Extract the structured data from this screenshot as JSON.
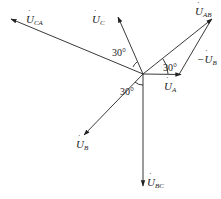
{
  "diagram": {
    "type": "phasor-diagram",
    "phasors": [
      {
        "id": "UA",
        "label": "U",
        "sub": "A",
        "dot": true,
        "angle_deg": 0
      },
      {
        "id": "UB",
        "label": "U",
        "sub": "B",
        "dot": true,
        "angle_deg": -120
      },
      {
        "id": "UC",
        "label": "U",
        "sub": "C",
        "dot": true,
        "angle_deg": 120
      },
      {
        "id": "UAB",
        "label": "U",
        "sub": "AB",
        "dot": true,
        "angle_deg": 30
      },
      {
        "id": "UBC",
        "label": "U",
        "sub": "BC",
        "dot": true,
        "angle_deg": -90
      },
      {
        "id": "UCA",
        "label": "U",
        "sub": "CA",
        "dot": true,
        "angle_deg": 150
      },
      {
        "id": "negUB",
        "label": "−U",
        "sub": "B",
        "dot": true,
        "angle_deg": 60
      }
    ],
    "angle_labels": [
      "30°",
      "30°",
      "30°"
    ]
  }
}
